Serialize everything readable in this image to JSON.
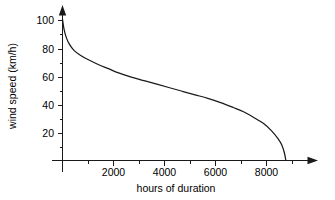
{
  "chart_data": {
    "type": "line",
    "title": "",
    "subtitle": "",
    "xlabel": "hours of duration",
    "ylabel": "wind speed (km/h)",
    "xlim": [
      0,
      10000
    ],
    "ylim": [
      0,
      108
    ],
    "grid": false,
    "legend": null,
    "x_ticks_major": [
      2000,
      4000,
      6000,
      8000
    ],
    "x_tick_labels": [
      "2000",
      "4000",
      "6000",
      "8000"
    ],
    "x_ticks_minor": [
      1000,
      3000,
      5000,
      7000,
      9000
    ],
    "y_ticks_major": [
      20,
      40,
      60,
      80,
      100
    ],
    "y_tick_labels": [
      "20",
      "40",
      "60",
      "80",
      "100"
    ],
    "y_ticks_minor": [
      10,
      30,
      50,
      70,
      90
    ],
    "series": [
      {
        "name": "wind speed duration curve",
        "x": [
          0,
          60,
          150,
          280,
          450,
          700,
          1000,
          1400,
          1800,
          2200,
          2700,
          3200,
          3700,
          4200,
          4700,
          5200,
          5700,
          6200,
          6700,
          7100,
          7500,
          7900,
          8200,
          8450,
          8600,
          8700,
          8760
        ],
        "y": [
          100,
          93,
          87,
          82,
          78,
          74.5,
          71.5,
          68,
          65,
          62,
          59,
          56.5,
          54,
          51.5,
          49,
          46.5,
          44,
          41,
          37.5,
          34.5,
          30.5,
          26,
          21,
          15.5,
          11,
          5.5,
          0
        ]
      }
    ]
  },
  "axes": {
    "x_axis_name": "x-axis",
    "y_axis_name": "y-axis"
  }
}
